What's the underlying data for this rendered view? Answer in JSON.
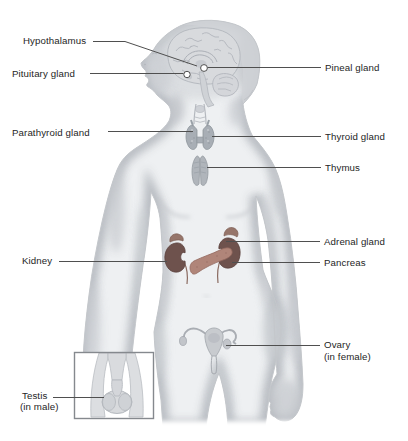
{
  "diagram": {
    "background_color": "#ffffff",
    "body_color": "#eef0f2",
    "body_shade_color": "#b5b9bf",
    "leader_line_color": "#4f4f4f",
    "label_text_color": "#252525",
    "organ_colors": {
      "kidney": "#6e524d",
      "adrenal": "#96756a",
      "pancreas": "#b08579",
      "thyroid": "#a8aeb5",
      "thymus": "#b0b5bb",
      "uterus": "#c8cbcf",
      "brain": "#d8dadd"
    }
  },
  "labels": {
    "left": [
      {
        "id": "hypothalamus",
        "text": "Hypothalamus"
      },
      {
        "id": "pituitary",
        "text": "Pituitary gland"
      },
      {
        "id": "parathyroid",
        "text": "Parathyroid gland"
      },
      {
        "id": "kidney",
        "text": "Kidney"
      },
      {
        "id": "testis",
        "text": "Testis",
        "subtext": "(in male)"
      }
    ],
    "right": [
      {
        "id": "pineal",
        "text": "Pineal gland"
      },
      {
        "id": "thyroid",
        "text": "Thyroid gland"
      },
      {
        "id": "thymus",
        "text": "Thymus"
      },
      {
        "id": "adrenal",
        "text": "Adrenal gland"
      },
      {
        "id": "pancreas",
        "text": "Pancreas"
      },
      {
        "id": "ovary",
        "text": "Ovary",
        "subtext": "(in female)"
      }
    ]
  }
}
